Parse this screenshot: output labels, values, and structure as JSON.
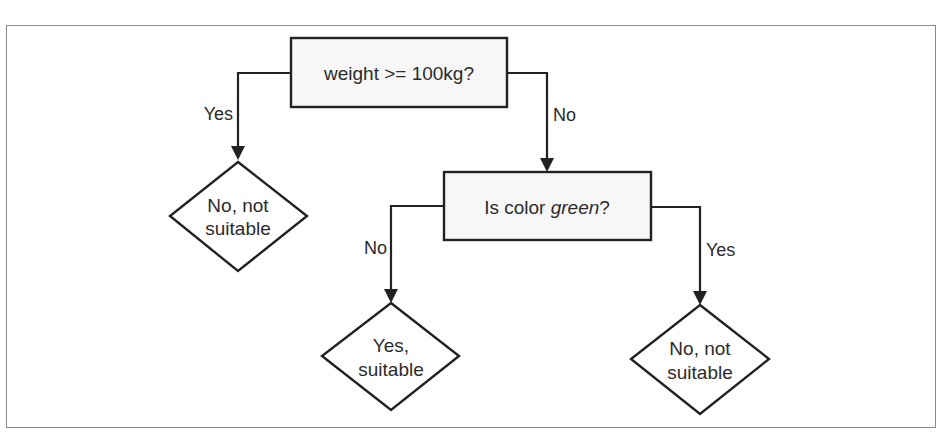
{
  "diagram": {
    "type": "decision-tree flowchart",
    "colors": {
      "stroke": "#222222",
      "box_fill": "#f7f7f7",
      "diamond_fill": "#ffffff",
      "frame": "#8a8a8a",
      "text": "#2b2b2b"
    },
    "nodes": {
      "root": {
        "shape": "rectangle",
        "label": "weight >= 100kg?"
      },
      "color_check": {
        "shape": "rectangle",
        "label_prefix": "Is color ",
        "label_emphasis": "green",
        "label_suffix": "?"
      },
      "leaf_heavy": {
        "shape": "diamond",
        "line1": "No, not",
        "line2": "suitable"
      },
      "leaf_not_green": {
        "shape": "diamond",
        "line1": "Yes,",
        "line2": "suitable"
      },
      "leaf_green": {
        "shape": "diamond",
        "line1": "No, not",
        "line2": "suitable"
      }
    },
    "edges": [
      {
        "from": "root",
        "to": "leaf_heavy",
        "label": "Yes"
      },
      {
        "from": "root",
        "to": "color_check",
        "label": "No"
      },
      {
        "from": "color_check",
        "to": "leaf_not_green",
        "label": "No"
      },
      {
        "from": "color_check",
        "to": "leaf_green",
        "label": "Yes"
      }
    ]
  }
}
